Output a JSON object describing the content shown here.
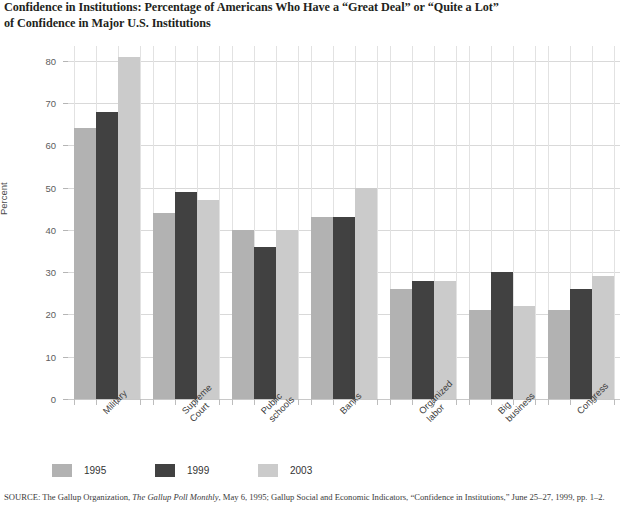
{
  "title": {
    "line1": "Confidence in Institutions: Percentage of Americans Who Have a “Great Deal” or “Quite a Lot”",
    "line2": "of Confidence in Major U.S. Institutions"
  },
  "source": {
    "prefix": "SOURCE: The Gallup Organization, ",
    "italic": "The Gallup Poll Monthly",
    "suffix": ", May 6, 1995; Gallup Social and Economic Indicators, “Confidence in Institutions,” June 25–27, 1999, pp. 1–2."
  },
  "legend": {
    "position": "bottom-left",
    "items": [
      {
        "label": "1995",
        "color": "#b2b2b2"
      },
      {
        "label": "1999",
        "color": "#414141"
      },
      {
        "label": "2003",
        "color": "#cbcbcb"
      }
    ]
  },
  "chart_data": {
    "type": "bar",
    "title": "Confidence in Institutions: Percentage of Americans Who Have a “Great Deal” or “Quite a Lot” of Confidence in Major U.S. Institutions",
    "xlabel": "",
    "ylabel": "Percent",
    "ylim": [
      0,
      83.5
    ],
    "yticks": [
      0,
      10,
      20,
      30,
      40,
      50,
      60,
      70,
      80
    ],
    "ytick_labels": [
      "0",
      "10",
      "20",
      "30",
      "40",
      "50",
      "60",
      "70",
      "80"
    ],
    "grid": "both",
    "legend_position": "bottom-left",
    "categories": [
      "Military",
      "Supreme Court",
      "Public schools",
      "Banks",
      "Organized labor",
      "Big business",
      "Congress"
    ],
    "category_label_lines": [
      [
        "Military"
      ],
      [
        "Supreme",
        "Court"
      ],
      [
        "Public",
        "schools"
      ],
      [
        "Banks"
      ],
      [
        "Organized",
        "labor"
      ],
      [
        "Big",
        "business"
      ],
      [
        "Congress"
      ]
    ],
    "series": [
      {
        "name": "1995",
        "color": "#b2b2b2",
        "values": [
          64,
          44,
          40,
          43,
          26,
          21,
          21
        ]
      },
      {
        "name": "1999",
        "color": "#414141",
        "values": [
          68,
          49,
          36,
          43,
          28,
          30,
          26
        ]
      },
      {
        "name": "2003",
        "color": "#cbcbcb",
        "values": [
          81,
          47,
          40,
          50,
          28,
          22,
          29
        ]
      }
    ]
  }
}
